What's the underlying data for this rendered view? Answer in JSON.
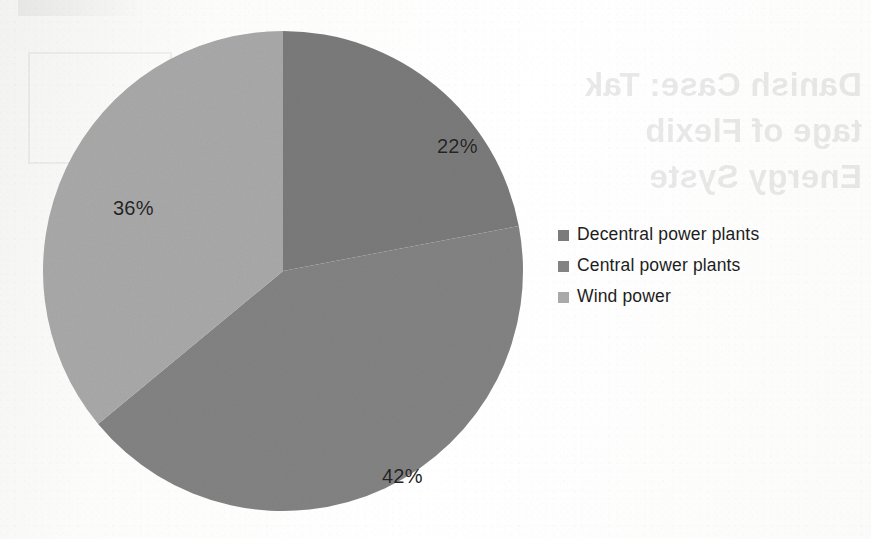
{
  "page": {
    "background_color": "#fbfbfa",
    "width": 871,
    "height": 539
  },
  "showthrough": {
    "note": "faint mirrored bleed-through text from the reverse side of the scanned page",
    "lines": [
      "Danish Case: Tak",
      "tage of Flexib",
      "Energy Syste"
    ]
  },
  "legend": {
    "position": "right",
    "items": [
      {
        "label": "Decentral power plants",
        "color": "#7b7b7b",
        "marker": "square-swatch"
      },
      {
        "label": "Central power plants",
        "color": "#838383",
        "marker": "square-swatch"
      },
      {
        "label": "Wind power",
        "color": "#a9a9a9",
        "marker": "square-swatch"
      }
    ]
  },
  "chart_data": {
    "type": "pie",
    "title": "",
    "subtitle": "",
    "xlabel": "",
    "ylabel": "",
    "grid": false,
    "legend_position": "right",
    "start_angle_deg": 0,
    "direction": "clockwise",
    "categories": [
      "Decentral power plants",
      "Central power plants",
      "Wind power"
    ],
    "values": [
      22,
      42,
      36
    ],
    "value_unit": "%",
    "data_labels": [
      "22%",
      "42%",
      "36%"
    ],
    "colors": [
      "#7b7b7b",
      "#838383",
      "#a9a9a9"
    ],
    "slices": [
      {
        "label": "Decentral power plants",
        "value": 22,
        "display": "22%",
        "color": "#7b7b7b",
        "start_angle_deg": 0,
        "end_angle_deg": 79.2,
        "label_x": 394,
        "label_y": 104
      },
      {
        "label": "Central power plants",
        "value": 42,
        "display": "42%",
        "color": "#838383",
        "start_angle_deg": 79.2,
        "end_angle_deg": 230.4,
        "label_x": 339,
        "label_y": 434
      },
      {
        "label": "Wind power",
        "value": 36,
        "display": "36%",
        "color": "#a9a9a9",
        "start_angle_deg": 230.4,
        "end_angle_deg": 360,
        "label_x": 70,
        "label_y": 166
      }
    ],
    "geometry": {
      "center_x": 283,
      "center_y": 271,
      "radius": 240
    }
  }
}
